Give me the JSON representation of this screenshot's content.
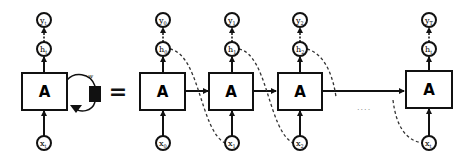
{
  "diagram": {
    "colors": {
      "stroke": "#111111",
      "background": "#ffffff",
      "dashed": "#333333"
    },
    "folded": {
      "cell_label": "A",
      "output": {
        "base": "y",
        "sub": "t"
      },
      "hidden": {
        "base": "h",
        "sub": "t"
      },
      "input": {
        "base": "x",
        "sub": "t"
      },
      "weight_label": "w"
    },
    "equals": "=",
    "ellipsis": "....",
    "unrolled": [
      {
        "cell_label": "A",
        "output": {
          "base": "y",
          "sub": "0"
        },
        "hidden": {
          "base": "h",
          "sub": "0"
        },
        "input": {
          "base": "x",
          "sub": "0"
        }
      },
      {
        "cell_label": "A",
        "output": {
          "base": "y",
          "sub": "1"
        },
        "hidden": {
          "base": "h",
          "sub": "1"
        },
        "input": {
          "base": "x",
          "sub": "1"
        }
      },
      {
        "cell_label": "A",
        "output": {
          "base": "y",
          "sub": "2"
        },
        "hidden": {
          "base": "h",
          "sub": "2"
        },
        "input": {
          "base": "x",
          "sub": "2"
        }
      },
      {
        "cell_label": "A",
        "output": {
          "base": "y",
          "sub": "T"
        },
        "hidden": {
          "base": "h",
          "sub": "t"
        },
        "input": {
          "base": "x",
          "sub": "t"
        }
      }
    ]
  }
}
